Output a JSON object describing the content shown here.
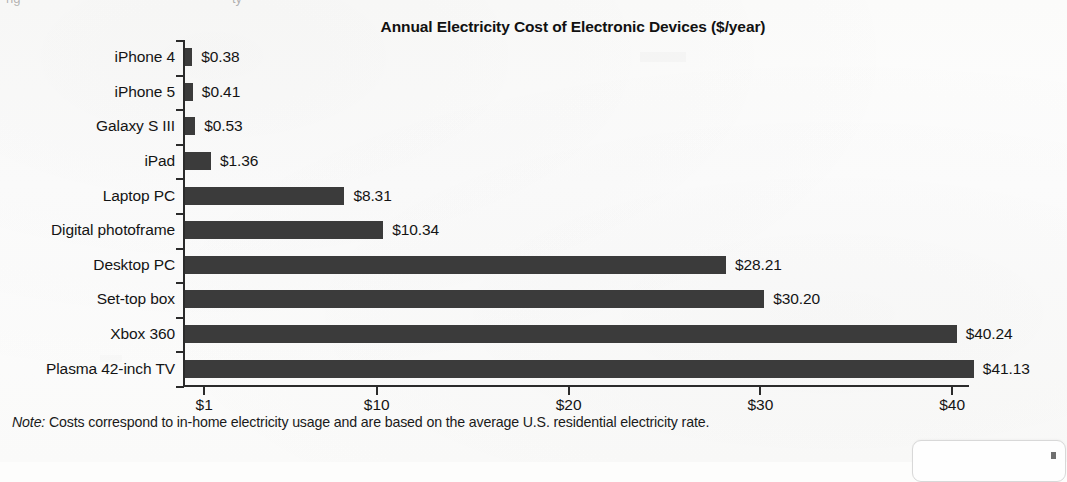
{
  "chart_data": {
    "type": "bar",
    "orientation": "horizontal",
    "title": "Annual Electricity Cost of Electronic Devices ($/year)",
    "xlabel": "",
    "ylabel": "",
    "grid": false,
    "legend": null,
    "xlim": [
      0,
      41.7
    ],
    "categories": [
      "iPhone 4",
      "iPhone 5",
      "Galaxy S III",
      "iPad",
      "Laptop PC",
      "Digital photoframe",
      "Desktop PC",
      "Set-top box",
      "Xbox 360",
      "Plasma 42-inch TV"
    ],
    "values": [
      0.38,
      0.41,
      0.53,
      1.36,
      8.31,
      10.34,
      28.21,
      30.2,
      40.24,
      41.13
    ],
    "value_labels": [
      "$0.38",
      "$0.41",
      "$0.53",
      "$1.36",
      "$8.31",
      "$10.34",
      "$28.21",
      "$30.20",
      "$40.24",
      "$41.13"
    ],
    "x_ticks": [
      1,
      10,
      20,
      30,
      40
    ],
    "x_tick_labels": [
      "$1",
      "$10",
      "$20",
      "$30",
      "$40"
    ],
    "bar_color": "#3b3b3b",
    "axis_color": "#2b2b2b"
  },
  "note": {
    "prefix": "Note:",
    "text": " Costs correspond to in-home electricity usage and are based on the average U.S. residential electricity rate."
  },
  "top_fragments": [
    "ng",
    "ty"
  ]
}
